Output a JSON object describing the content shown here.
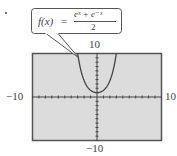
{
  "figure": {
    "bullet": "•",
    "callout": {
      "lhs": "f(x)",
      "equals": "=",
      "numerator": "eˣ + e⁻ˣ",
      "denominator": "2"
    },
    "window_labels": {
      "ymax": "10",
      "ymin": "−10",
      "xmin": "−10",
      "xmax": "10"
    }
  },
  "colors": {
    "screen_background": "#dcdcdc",
    "frame": "#555555",
    "curve": "#444444",
    "axes": "#444444"
  },
  "chart_data": {
    "type": "line",
    "function": "cosh(x)",
    "xlabel": "",
    "ylabel": "",
    "xlim": [
      -10,
      10
    ],
    "ylim": [
      -10,
      10
    ],
    "xscale": 1,
    "yscale": 1,
    "grid": false,
    "legend": "none",
    "series": [
      {
        "name": "f(x) = (e^x + e^-x)/2",
        "x": [
          -3,
          -2.5,
          -2,
          -1.5,
          -1,
          -0.5,
          0,
          0.5,
          1,
          1.5,
          2,
          2.5,
          3
        ],
        "values": [
          10.07,
          6.13,
          3.76,
          2.35,
          1.54,
          1.13,
          1.0,
          1.13,
          1.54,
          2.35,
          3.76,
          6.13,
          10.07
        ]
      }
    ],
    "annotations": [
      "Callout: f(x) = (e^x + e^-x)/2 pointing to left branch of curve"
    ],
    "tick_labels": {
      "ymax": "10",
      "ymin": "-10",
      "xmin": "-10",
      "xmax": "10"
    }
  }
}
